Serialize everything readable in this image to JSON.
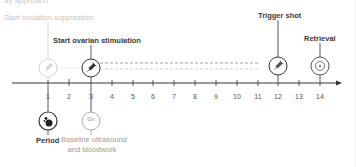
{
  "heading_partial": "ay approach",
  "events_top": [
    {
      "day": 1,
      "label": "Start ovulation suppression",
      "style": "faded",
      "icon": "syringe-icon"
    },
    {
      "day": 3,
      "label": "Start ovarian stimulation",
      "style": "bold",
      "icon": "syringe-icon"
    },
    {
      "day": 12,
      "label": "Trigger shot",
      "style": "bold",
      "icon": "syringe-icon"
    },
    {
      "day": 14,
      "label": "Retrieval",
      "style": "bold",
      "icon": "target-icon"
    }
  ],
  "events_bottom": [
    {
      "day": 1,
      "label": "Period",
      "style": "bold",
      "icon": "blood-drop-icon"
    },
    {
      "day": 3,
      "label_line1": "Baseline ultrasound",
      "label_line2": "and bloodwork",
      "style": "sub",
      "icon": "dx-icon",
      "icon_text": "Dx"
    }
  ],
  "axis": {
    "days": [
      "1",
      "2",
      "3",
      "4",
      "5",
      "6",
      "7",
      "8",
      "9",
      "10",
      "11",
      "12",
      "13",
      "14"
    ]
  },
  "colors": {
    "line": "#333333",
    "faded": "#c4c4c4",
    "dashed_dark": "#777777",
    "dashed_light": "#bbbbbb",
    "subtext": "#9a9a9a"
  }
}
